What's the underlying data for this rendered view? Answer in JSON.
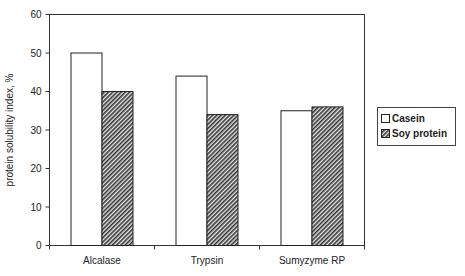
{
  "chart_data": {
    "type": "bar",
    "title": "",
    "xlabel": "",
    "ylabel": "protein solubility index, %",
    "ylim": [
      0,
      60
    ],
    "yticks": [
      0,
      10,
      20,
      30,
      40,
      50,
      60
    ],
    "grid": false,
    "legend_position": "right",
    "categories": [
      "Alcalase",
      "Trypsin",
      "Sumyzyme RP"
    ],
    "series": [
      {
        "name": "Casein",
        "values": [
          50,
          44,
          35
        ],
        "fill": "white"
      },
      {
        "name": "Soy protein",
        "values": [
          40,
          34,
          36
        ],
        "fill": "diagonal-hatch"
      }
    ]
  },
  "colors": {
    "axis": "#333333",
    "bar_outline": "#222222",
    "hatch": "#333333",
    "background": "#ffffff"
  }
}
